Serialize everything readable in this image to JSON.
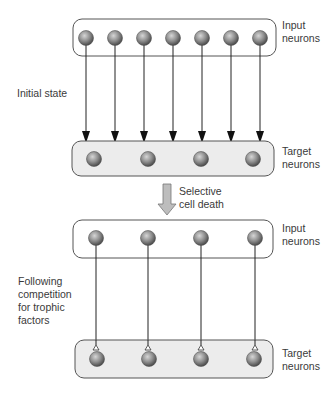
{
  "labels": {
    "top_input": [
      "Input",
      "neurons"
    ],
    "initial_state": "Initial state",
    "top_target": [
      "Target",
      "neurons"
    ],
    "transition": [
      "Selective",
      "cell death"
    ],
    "bottom_input": [
      "Input",
      "neurons"
    ],
    "following": [
      "Following",
      "competition",
      "for trophic",
      "factors"
    ],
    "bottom_target": [
      "Target",
      "neurons"
    ]
  },
  "panels": {
    "initial": {
      "input_neuron_count": 7,
      "target_neuron_count": 4,
      "connections": 7,
      "connection_style": "arrow"
    },
    "final": {
      "input_neuron_count": 4,
      "target_neuron_count": 4,
      "connections": 4,
      "connection_style": "synapse-terminal"
    }
  },
  "colors": {
    "box_stroke": "#555555",
    "target_fill": "#ececec",
    "neuron_light": "#c8c8c8",
    "neuron_dark": "#5a5a5a",
    "line": "#222222",
    "big_arrow_fill": "#bdbdbd"
  }
}
